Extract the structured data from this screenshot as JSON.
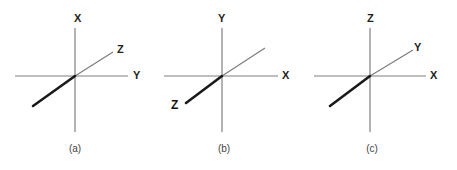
{
  "figure": {
    "background_color": "#ffffff",
    "axis_color": "#808080",
    "diagonal_thin_color": "#7a7a7a",
    "diagonal_bold_color": "#1a1a1a",
    "label_color": "#231f20",
    "caption_color": "#3f3f3f"
  },
  "panels": [
    {
      "id": "a",
      "caption": "(a)",
      "vertical_axis_label": "X",
      "horizontal_axis_label": "Y",
      "diagonal_axis_label": "Z",
      "diagonal_label_position": "upper-right",
      "vertical_label_position": "top",
      "horizontal_label_position": "right"
    },
    {
      "id": "b",
      "caption": "(b)",
      "vertical_axis_label": "Y",
      "horizontal_axis_label": "X",
      "diagonal_axis_label": "Z",
      "diagonal_label_position": "lower-left",
      "vertical_label_position": "top",
      "horizontal_label_position": "right"
    },
    {
      "id": "c",
      "caption": "(c)",
      "vertical_axis_label": "Z",
      "horizontal_axis_label": "X",
      "diagonal_axis_label": "Y",
      "diagonal_label_position": "upper-right",
      "vertical_label_position": "top",
      "horizontal_label_position": "right"
    }
  ]
}
